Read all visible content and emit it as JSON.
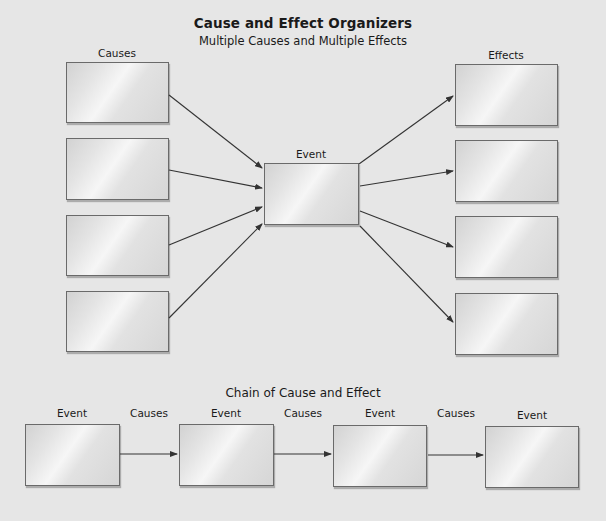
{
  "header": {
    "title": "Cause and Effect Organizers",
    "subtitle": "Multiple Causes and Multiple Effects"
  },
  "multiple_organizer": {
    "causes_label": "Causes",
    "event_label": "Event",
    "effects_label": "Effects",
    "cause_boxes": [
      "",
      "",
      "",
      ""
    ],
    "effect_boxes": [
      "",
      "",
      "",
      ""
    ],
    "event_box": ""
  },
  "chain_organizer": {
    "title": "Chain of Cause and Effect",
    "event_labels": [
      "Event",
      "Event",
      "Event",
      "Event"
    ],
    "connector_labels": [
      "Causes",
      "Causes",
      "Causes"
    ]
  },
  "colors": {
    "background": "#e6e6e6",
    "box_border": "#6a6a6a",
    "arrow": "#333333"
  }
}
